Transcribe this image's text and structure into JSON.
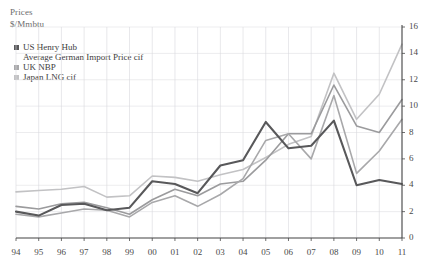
{
  "titles": {
    "line1": "Prices",
    "line2": "$/Mmbtu"
  },
  "legend": {
    "items": [
      {
        "label": "US Henry Hub",
        "color": "#58585a",
        "swatch": true
      },
      {
        "label": "Average German Import Price cif",
        "color": "#9b9b9d",
        "swatch": false
      },
      {
        "label": "UK NBP",
        "color": "#a8a8aa",
        "swatch": true
      },
      {
        "label": "Japan LNG cif",
        "color": "#c2c2c4",
        "swatch": true
      }
    ]
  },
  "axes": {
    "y_ticks": [
      "0",
      "2",
      "4",
      "6",
      "8",
      "10",
      "12",
      "14",
      "16"
    ],
    "x_ticks": [
      "94",
      "95",
      "96",
      "97",
      "98",
      "99",
      "00",
      "01",
      "02",
      "03",
      "04",
      "05",
      "06",
      "07",
      "08",
      "09",
      "10",
      "11"
    ]
  },
  "colors": {
    "us_henry_hub": "#58585a",
    "german_import": "#9b9b9d",
    "uk_nbp": "#a8a8aa",
    "japan_lng": "#c2c2c4",
    "axis": "#4a4a4a",
    "grid": "#d9d9dd"
  },
  "chart_data": {
    "type": "line",
    "title": "Prices",
    "xlabel": "",
    "ylabel": "$/Mmbtu",
    "ylim": [
      0,
      16
    ],
    "ytick_step": 2,
    "grid": true,
    "legend_position": "top-left",
    "categories": [
      "94",
      "95",
      "96",
      "97",
      "98",
      "99",
      "00",
      "01",
      "02",
      "03",
      "04",
      "05",
      "06",
      "07",
      "08",
      "09",
      "10",
      "11"
    ],
    "series": [
      {
        "name": "US Henry Hub",
        "color": "#58585a",
        "values": [
          2.0,
          1.7,
          2.5,
          2.6,
          2.1,
          2.3,
          4.3,
          4.1,
          3.4,
          5.5,
          5.9,
          8.8,
          6.8,
          7.0,
          8.9,
          4.0,
          4.4,
          4.1
        ]
      },
      {
        "name": "Average German Import Price cif",
        "color": "#9b9b9d",
        "values": [
          2.4,
          2.2,
          2.6,
          2.7,
          2.3,
          1.8,
          2.9,
          3.7,
          3.2,
          4.1,
          4.3,
          5.9,
          7.9,
          7.9,
          11.6,
          8.5,
          8.0,
          10.5
        ]
      },
      {
        "name": "UK NBP",
        "color": "#a8a8aa",
        "values": [
          1.8,
          1.6,
          1.9,
          2.2,
          2.1,
          1.6,
          2.7,
          3.2,
          2.4,
          3.3,
          4.5,
          7.4,
          7.9,
          6.0,
          10.8,
          4.9,
          6.6,
          9.0
        ]
      },
      {
        "name": "Japan LNG cif",
        "color": "#c2c2c4",
        "values": [
          3.5,
          3.6,
          3.7,
          3.9,
          3.1,
          3.2,
          4.7,
          4.6,
          4.3,
          4.8,
          5.2,
          6.1,
          7.1,
          7.7,
          12.5,
          9.0,
          10.9,
          14.7
        ]
      }
    ]
  }
}
